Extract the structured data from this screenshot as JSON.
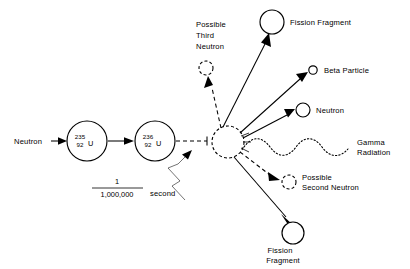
{
  "diagram": {
    "background_color": "#ffffff",
    "ink_color": "#000000",
    "input": {
      "neutron_label": "Neutron"
    },
    "nuclei": [
      {
        "id": "u235",
        "mass_number": "235",
        "atomic_number": "92",
        "element": "U",
        "cx": 87,
        "cy": 141,
        "r": 20
      },
      {
        "id": "u236",
        "mass_number": "236",
        "atomic_number": "92",
        "element": "U",
        "cx": 155,
        "cy": 141,
        "r": 20
      }
    ],
    "compound_nucleus": {
      "label": "",
      "cx": 228,
      "cy": 142,
      "r": 16,
      "style": "dashed"
    },
    "timing": {
      "numerator": "1",
      "denominator": "1,000,000",
      "unit": "second"
    },
    "products": [
      {
        "id": "fission-fragment-top",
        "label": "Fission Fragment",
        "lines": [
          "Fission Fragment"
        ],
        "cx": 272,
        "cy": 22,
        "r": 12,
        "circle_style": "solid",
        "ray_style": "solid"
      },
      {
        "id": "beta-particle",
        "label": "Beta Particle",
        "lines": [
          "Beta Particle"
        ],
        "cx": 313,
        "cy": 70,
        "r": 4.2,
        "circle_style": "solid",
        "ray_style": "solid"
      },
      {
        "id": "neutron-emitted",
        "label": "Neutron",
        "lines": [
          "Neutron"
        ],
        "cx": 303,
        "cy": 110,
        "r": 7,
        "circle_style": "solid",
        "ray_style": "solid"
      },
      {
        "id": "gamma-radiation",
        "label": "Gamma Radiation",
        "lines": [
          "Gamma",
          "Radiation"
        ],
        "circle_style": "none",
        "ray_style": "wave"
      },
      {
        "id": "possible-second-neutron",
        "label": "Possible Second Neutron",
        "lines": [
          "Possible",
          "Second Neutron"
        ],
        "cx": 289,
        "cy": 182,
        "r": 7,
        "circle_style": "dashed",
        "ray_style": "dashed"
      },
      {
        "id": "fission-fragment-bottom",
        "label": "Fission Fragment",
        "lines": [
          "Fission",
          "Fragment"
        ],
        "cx": 293,
        "cy": 233,
        "r": 11,
        "circle_style": "solid",
        "ray_style": "solid"
      },
      {
        "id": "possible-third-neutron",
        "label": "Possible Third Neutron",
        "lines": [
          "Possible",
          "Third",
          "Neutron"
        ],
        "cx": 206,
        "cy": 68,
        "r": 7,
        "circle_style": "dashed",
        "ray_style": "dashed"
      }
    ]
  }
}
